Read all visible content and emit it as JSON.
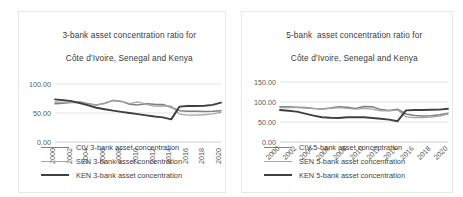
{
  "figure": {
    "background": "#ffffff"
  },
  "charts": [
    {
      "id": "left",
      "title_line1": "3-bank asset concentration ratio for",
      "title_line2": "Côte d’Ivoire, Senegal and Kenya",
      "tick_rotation": -90,
      "chart_data": {
        "type": "line",
        "title": "3-bank asset concentration ratio for Côte d’Ivoire, Senegal and Kenya",
        "xlabel": "",
        "ylabel": "",
        "ylim": [
          0,
          100
        ],
        "yticks": [
          "0.00",
          "50.00",
          "100.00"
        ],
        "ytick_values": [
          0,
          50,
          100
        ],
        "grid": true,
        "legend_position": "bottom",
        "x": [
          2000,
          2001,
          2002,
          2003,
          2004,
          2005,
          2006,
          2007,
          2008,
          2009,
          2010,
          2011,
          2012,
          2013,
          2014,
          2015,
          2016,
          2017,
          2018,
          2019,
          2020
        ],
        "xticks": [
          "2000",
          "2002",
          "2004",
          "2006",
          "2008",
          "2010",
          "2012",
          "2014",
          "2016",
          "2018",
          "2020"
        ],
        "series": [
          {
            "name": "CIV 3-bank asset concentration",
            "color": "#7f7f7f",
            "width": 1.5,
            "values": [
              66.0,
              67.0,
              68.5,
              69.0,
              66.0,
              64.0,
              67.0,
              71.5,
              70.0,
              65.0,
              64.0,
              66.0,
              65.0,
              64.5,
              60.0,
              54.0,
              53.0,
              53.0,
              52.5,
              53.0,
              54.0
            ]
          },
          {
            "name": "SEN 3-bank asset concentration",
            "color": "#a6a6a6",
            "width": 1.3,
            "values": [
              69.0,
              68.0,
              68.0,
              67.5,
              65.0,
              63.5,
              66.0,
              72.0,
              70.5,
              66.0,
              69.0,
              65.0,
              62.0,
              62.5,
              62.0,
              48.0,
              46.5,
              46.5,
              47.0,
              48.5,
              51.0
            ]
          },
          {
            "name": "KEN 3-bank asset concentration",
            "color": "#404040",
            "width": 1.9,
            "values": [
              73.5,
              72.0,
              70.5,
              67.0,
              63.0,
              59.0,
              56.5,
              54.0,
              52.0,
              50.0,
              48.0,
              46.0,
              44.0,
              42.5,
              39.0,
              61.0,
              62.0,
              62.0,
              62.5,
              64.0,
              68.0
            ]
          }
        ]
      }
    },
    {
      "id": "right",
      "title_line1": "5-bank  asset concentration ratio for",
      "title_line2": "Côte d’Ivoire, Senegal and Kenya",
      "tick_rotation": -45,
      "chart_data": {
        "type": "line",
        "title": "5-bank  asset concentration ratio for Côte d’Ivoire, Senegal and Kenya",
        "xlabel": "",
        "ylabel": "",
        "ylim": [
          0,
          150
        ],
        "yticks": [
          "0.00",
          "50.00",
          "100.00",
          "150.00"
        ],
        "ytick_values": [
          0,
          50,
          100,
          150
        ],
        "grid": true,
        "legend_position": "bottom",
        "x": [
          2000,
          2001,
          2002,
          2003,
          2004,
          2005,
          2006,
          2007,
          2008,
          2009,
          2010,
          2011,
          2012,
          2013,
          2014,
          2015,
          2016,
          2017,
          2018,
          2019,
          2020
        ],
        "xticks": [
          "2000",
          "2002",
          "2004",
          "2006",
          "2008",
          "2010",
          "2012",
          "2014",
          "2016",
          "2018",
          "2020"
        ],
        "series": [
          {
            "name": "CIV 5-bank asset concentration",
            "color": "#7f7f7f",
            "width": 1.5,
            "values": [
              88.0,
              88.0,
              87.0,
              86.0,
              84.0,
              82.5,
              85.0,
              88.0,
              87.0,
              84.0,
              89.0,
              88.0,
              81.0,
              79.0,
              82.0,
              70.0,
              66.0,
              65.0,
              65.5,
              68.0,
              72.0
            ]
          },
          {
            "name": "SEN 5-bank asset concentration",
            "color": "#a6a6a6",
            "width": 1.3,
            "values": [
              86.0,
              86.5,
              86.0,
              85.0,
              84.0,
              82.0,
              84.0,
              86.0,
              84.0,
              82.0,
              84.0,
              82.0,
              78.0,
              78.0,
              80.0,
              63.0,
              61.0,
              61.0,
              62.0,
              65.0,
              70.0
            ]
          },
          {
            "name": "KEN 5-bank asset concentration",
            "color": "#404040",
            "width": 1.9,
            "values": [
              80.0,
              78.0,
              76.0,
              71.0,
              66.0,
              62.0,
              60.5,
              60.0,
              62.0,
              62.0,
              62.0,
              60.0,
              58.0,
              56.0,
              52.0,
              79.0,
              80.0,
              80.0,
              80.5,
              81.0,
              83.0
            ]
          }
        ]
      }
    }
  ]
}
